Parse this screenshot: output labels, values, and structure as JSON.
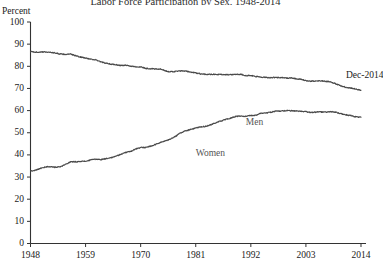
{
  "chart_data": {
    "type": "line",
    "title": "Labor Force Participation by Sex, 1948-2014",
    "xlabel": "",
    "ylabel": "Percent",
    "ylim": [
      0,
      100
    ],
    "xlim": [
      1948,
      2015
    ],
    "grid": false,
    "legend_position": "inline-labels",
    "ytick_labels": [
      "100",
      "90",
      "80",
      "70",
      "60",
      "50",
      "40",
      "30",
      "20",
      "10",
      "0"
    ],
    "ytick_values": [
      100,
      90,
      80,
      70,
      60,
      50,
      40,
      30,
      20,
      10,
      0
    ],
    "xtick_labels": [
      "1948",
      "1959",
      "1970",
      "1981",
      "1992",
      "2003",
      "2014"
    ],
    "xtick_values": [
      1948,
      1959,
      1970,
      1981,
      1992,
      2003,
      2014
    ],
    "annotations": [
      {
        "text": "Dec-2014",
        "x": 2011,
        "y": 76
      }
    ],
    "x": [
      1948,
      1949,
      1950,
      1951,
      1952,
      1953,
      1954,
      1955,
      1956,
      1957,
      1958,
      1959,
      1960,
      1961,
      1962,
      1963,
      1964,
      1965,
      1966,
      1967,
      1968,
      1969,
      1970,
      1971,
      1972,
      1973,
      1974,
      1975,
      1976,
      1977,
      1978,
      1979,
      1980,
      1981,
      1982,
      1983,
      1984,
      1985,
      1986,
      1987,
      1988,
      1989,
      1990,
      1991,
      1992,
      1993,
      1994,
      1995,
      1996,
      1997,
      1998,
      1999,
      2000,
      2001,
      2002,
      2003,
      2004,
      2005,
      2006,
      2007,
      2008,
      2009,
      2010,
      2011,
      2012,
      2013,
      2014
    ],
    "series": [
      {
        "name": "Men",
        "label": "Men",
        "label_x": 1991,
        "label_y": 55,
        "color": "#4a4a4a",
        "values": [
          86.6,
          86.4,
          86.4,
          86.5,
          86.3,
          86.0,
          85.5,
          85.4,
          85.5,
          84.8,
          84.2,
          83.7,
          83.3,
          82.9,
          82.0,
          81.4,
          81.0,
          80.7,
          80.4,
          80.4,
          80.1,
          79.8,
          79.7,
          79.1,
          78.9,
          78.8,
          78.7,
          77.9,
          77.5,
          77.7,
          77.9,
          77.8,
          77.4,
          77.0,
          76.6,
          76.4,
          76.4,
          76.3,
          76.3,
          76.2,
          76.2,
          76.4,
          76.4,
          75.8,
          75.8,
          75.4,
          75.1,
          75.0,
          74.9,
          75.0,
          74.9,
          74.7,
          74.8,
          74.4,
          74.1,
          73.5,
          73.3,
          73.3,
          73.5,
          73.2,
          73.0,
          72.0,
          71.2,
          70.5,
          70.2,
          69.7,
          69.2
        ]
      },
      {
        "name": "Women",
        "label": "Women",
        "label_x": 1981,
        "label_y": 41,
        "color": "#4a4a4a",
        "values": [
          32.7,
          33.1,
          33.9,
          34.6,
          34.7,
          34.4,
          34.6,
          35.7,
          36.9,
          36.9,
          37.1,
          37.1,
          37.7,
          38.1,
          37.9,
          38.3,
          38.7,
          39.3,
          40.3,
          41.1,
          41.6,
          42.7,
          43.3,
          43.4,
          43.9,
          44.7,
          45.7,
          46.3,
          47.3,
          48.4,
          50.0,
          50.9,
          51.5,
          52.1,
          52.6,
          52.9,
          53.6,
          54.5,
          55.3,
          56.0,
          56.6,
          57.4,
          57.5,
          57.4,
          57.8,
          57.9,
          58.8,
          58.9,
          59.3,
          59.8,
          59.8,
          60.0,
          59.9,
          59.8,
          59.6,
          59.5,
          59.2,
          59.3,
          59.4,
          59.3,
          59.5,
          59.2,
          58.6,
          58.1,
          57.7,
          57.2,
          57.0
        ]
      }
    ]
  }
}
